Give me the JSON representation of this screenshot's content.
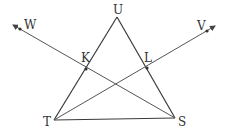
{
  "diagram": {
    "type": "geometry",
    "points": {
      "U": {
        "label": "U",
        "x": 117,
        "y": 17
      },
      "T": {
        "label": "T",
        "x": 54,
        "y": 120
      },
      "S": {
        "label": "S",
        "x": 175,
        "y": 118
      },
      "K": {
        "label": "K",
        "x": 86,
        "y": 69
      },
      "L": {
        "label": "L",
        "x": 147,
        "y": 68
      },
      "W": {
        "label": "W",
        "x": 20,
        "y": 29
      },
      "V": {
        "label": "V",
        "x": 207,
        "y": 31
      }
    },
    "segments": [
      [
        "T",
        "U"
      ],
      [
        "U",
        "S"
      ],
      [
        "T",
        "S"
      ]
    ],
    "rays": [
      [
        "S",
        "W"
      ],
      [
        "T",
        "V"
      ]
    ],
    "colors": {
      "line": "#3a3a3a",
      "background": "#ffffff"
    }
  }
}
